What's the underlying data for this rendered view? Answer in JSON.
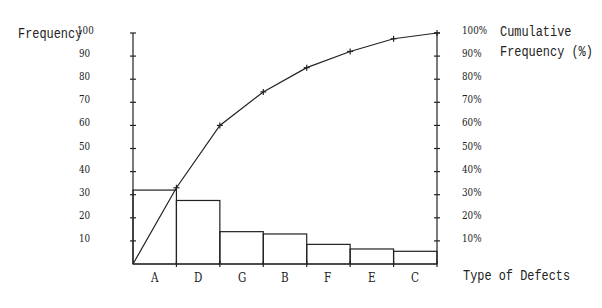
{
  "chart_data": {
    "type": "pareto",
    "title": "",
    "xlabel": "Type of Defects",
    "ylabel": "Frequency",
    "y2label": "Cumulative Frequency (%)",
    "categories": [
      "A",
      "D",
      "G",
      "B",
      "F",
      "E",
      "C"
    ],
    "series": [
      {
        "name": "Frequency",
        "type": "bar",
        "values": [
          32,
          27.5,
          14,
          13,
          8.5,
          6.5,
          5.5
        ]
      },
      {
        "name": "Cumulative Frequency (%)",
        "type": "line",
        "values": [
          33,
          60,
          74.5,
          85,
          92,
          97.5,
          100
        ]
      }
    ],
    "ylim": [
      0,
      100
    ],
    "y2lim": [
      0,
      100
    ],
    "yticks": [
      "10",
      "20",
      "30",
      "40",
      "50",
      "60",
      "70",
      "80",
      "90",
      "100"
    ],
    "y2ticks": [
      "10%",
      "20%",
      "30%",
      "40%",
      "50%",
      "60%",
      "70%",
      "80%",
      "90%",
      "100%"
    ],
    "grid": false,
    "legend": "none"
  },
  "labels": {
    "left_axis": "Frequency",
    "right_axis_line1": "Cumulative",
    "right_axis_line2": "Frequency (%)",
    "x_axis": "Type of Defects"
  }
}
